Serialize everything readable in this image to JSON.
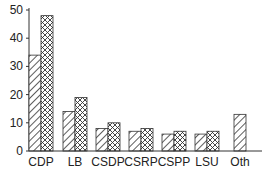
{
  "chart_data": {
    "type": "bar",
    "title": "",
    "xlabel": "",
    "ylabel": "",
    "ylim": [
      0,
      50
    ],
    "yticks": [
      0,
      10,
      20,
      30,
      40,
      50
    ],
    "grid": false,
    "legend": null,
    "categories": [
      "CDP",
      "LB",
      "CSDP",
      "CSRP",
      "CSPP",
      "LSU",
      "Oth"
    ],
    "series": [
      {
        "name": "diagonal-hatch",
        "pattern": "diagonal",
        "values": [
          34,
          14,
          8,
          7,
          6,
          6,
          13
        ]
      },
      {
        "name": "cross-hatch",
        "pattern": "crosshatch",
        "values": [
          48,
          19,
          10,
          8,
          7,
          7,
          null
        ]
      }
    ]
  }
}
